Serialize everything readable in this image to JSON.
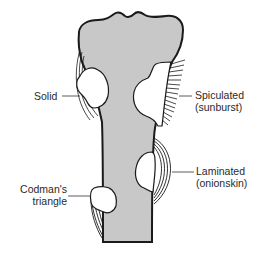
{
  "figure": {
    "colors": {
      "bone_fill": "#c8c8c8",
      "outline": "#1a1a1a",
      "lesion_fill": "#ffffff",
      "leader_line": "#333333",
      "text": "#2a2a2a"
    }
  },
  "labels": {
    "solid": "Solid",
    "spiculated_line1": "Spiculated",
    "spiculated_line2": "(sunburst)",
    "laminated_line1": "Laminated",
    "laminated_line2": "(onionskin)",
    "codman_line1": "Codman's",
    "codman_line2": "triangle"
  }
}
